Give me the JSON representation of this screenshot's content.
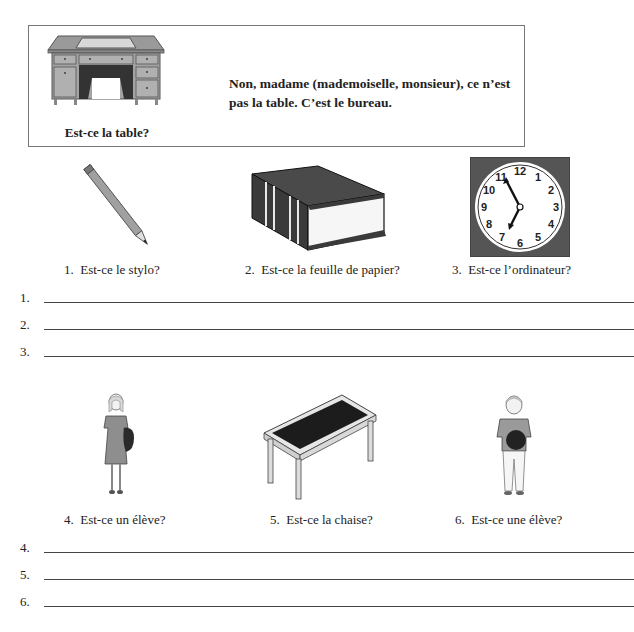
{
  "example": {
    "question": "Est-ce la table?",
    "answer": "Non, madame (mademoiselle, monsieur), ce n’est pas la table. C’est le bureau.",
    "image": "desk-illustration"
  },
  "items_row1": [
    {
      "number": "1.",
      "question": "Est-ce le stylo?",
      "image": "pencil-illustration"
    },
    {
      "number": "2.",
      "question": "Est-ce la feuille de papier?",
      "image": "book-illustration"
    },
    {
      "number": "3.",
      "question": "Est-ce l’ordinateur?",
      "image": "clock-illustration"
    }
  ],
  "items_row2": [
    {
      "number": "4.",
      "question": "Est-ce un élève?",
      "image": "girl-student-illustration"
    },
    {
      "number": "5.",
      "question": "Est-ce la chaise?",
      "image": "table-illustration"
    },
    {
      "number": "6.",
      "question": "Est-ce une élève?",
      "image": "boy-student-illustration"
    }
  ],
  "answer_lines": [
    {
      "label": "1.",
      "value": ""
    },
    {
      "label": "2.",
      "value": ""
    },
    {
      "label": "3.",
      "value": ""
    },
    {
      "label": "4.",
      "value": ""
    },
    {
      "label": "5.",
      "value": ""
    },
    {
      "label": "6.",
      "value": ""
    }
  ],
  "clock": {
    "numbers": [
      "12",
      "1",
      "2",
      "3",
      "4",
      "5",
      "6",
      "7",
      "8",
      "9",
      "10",
      "11"
    ],
    "time_shown": "11:35"
  }
}
